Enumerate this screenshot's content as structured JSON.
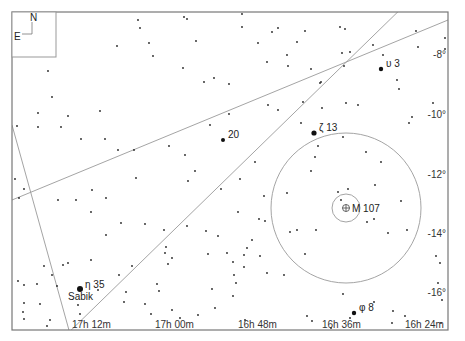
{
  "compass": {
    "north": "N",
    "east": "E"
  },
  "frame": {
    "x": 12,
    "y": 12,
    "w": 436,
    "h": 318
  },
  "ra_labels": [
    {
      "text": "17h 12m",
      "x": 72
    },
    {
      "text": "17h 00m",
      "x": 155
    },
    {
      "text": "16h 48m",
      "x": 238
    },
    {
      "text": "16h 36m",
      "x": 322
    },
    {
      "text": "16h 24m",
      "x": 405
    }
  ],
  "dec_labels": [
    {
      "text": "-8°",
      "y": 58
    },
    {
      "text": "-10°",
      "y": 118
    },
    {
      "text": "-12°",
      "y": 178
    },
    {
      "text": "-14°",
      "y": 237
    },
    {
      "text": "-16°",
      "y": 296
    }
  ],
  "named_stars": [
    {
      "label": "υ 3",
      "x": 381,
      "y": 69,
      "r": 2.2
    },
    {
      "label": "ζ 13",
      "x": 314,
      "y": 133,
      "r": 2.6
    },
    {
      "label": "20",
      "x": 223,
      "y": 140,
      "r": 2.0
    },
    {
      "label": "η 35",
      "sub": "Sabik",
      "x": 80,
      "y": 289,
      "r": 3.0
    },
    {
      "label": "φ 8",
      "x": 354,
      "y": 313,
      "r": 2.2
    }
  ],
  "deep_sky": {
    "label": "M 107",
    "x": 346,
    "y": 208,
    "inner_r": 14,
    "outer_r": 75
  },
  "lines": [
    {
      "x1": 12,
      "y1": 200,
      "x2": 448,
      "y2": 20
    },
    {
      "x1": 60,
      "y1": 341,
      "x2": 410,
      "y2": 0
    },
    {
      "x1": 12,
      "y1": 125,
      "x2": 72,
      "y2": 341
    }
  ],
  "stars": [
    [
      138,
      20
    ],
    [
      140,
      28
    ],
    [
      149,
      43
    ],
    [
      153,
      56
    ],
    [
      184,
      17
    ],
    [
      187,
      19
    ],
    [
      196,
      41
    ],
    [
      183,
      68
    ],
    [
      117,
      46
    ],
    [
      204,
      82
    ],
    [
      214,
      78
    ],
    [
      229,
      84
    ],
    [
      48,
      71
    ],
    [
      52,
      97
    ],
    [
      38,
      113
    ],
    [
      68,
      116
    ],
    [
      100,
      111
    ],
    [
      229,
      114
    ],
    [
      17,
      126
    ],
    [
      38,
      127
    ],
    [
      61,
      127
    ],
    [
      81,
      139
    ],
    [
      105,
      139
    ],
    [
      118,
      150
    ],
    [
      134,
      150
    ],
    [
      169,
      146
    ],
    [
      185,
      155
    ],
    [
      195,
      171
    ],
    [
      188,
      181
    ],
    [
      15,
      179
    ],
    [
      24,
      189
    ],
    [
      19,
      198
    ],
    [
      58,
      200
    ],
    [
      76,
      200
    ],
    [
      92,
      190
    ],
    [
      106,
      198
    ],
    [
      91,
      212
    ],
    [
      121,
      223
    ],
    [
      106,
      235
    ],
    [
      145,
      224
    ],
    [
      165,
      253
    ],
    [
      166,
      247
    ],
    [
      210,
      125
    ],
    [
      255,
      162
    ],
    [
      221,
      189
    ],
    [
      242,
      14
    ],
    [
      242,
      27
    ],
    [
      278,
      28
    ],
    [
      258,
      43
    ],
    [
      272,
      32
    ],
    [
      305,
      31
    ],
    [
      297,
      42
    ],
    [
      287,
      55
    ],
    [
      288,
      66
    ],
    [
      267,
      62
    ],
    [
      303,
      102
    ],
    [
      268,
      105
    ],
    [
      278,
      110
    ],
    [
      311,
      69
    ],
    [
      322,
      108
    ],
    [
      320,
      83
    ],
    [
      342,
      53
    ],
    [
      321,
      82
    ],
    [
      340,
      27
    ],
    [
      345,
      29
    ],
    [
      344,
      66
    ],
    [
      350,
      52
    ],
    [
      346,
      103
    ],
    [
      358,
      105
    ],
    [
      373,
      45
    ],
    [
      383,
      55
    ],
    [
      397,
      80
    ],
    [
      399,
      89
    ],
    [
      409,
      123
    ],
    [
      412,
      117
    ],
    [
      416,
      31
    ],
    [
      418,
      47
    ],
    [
      445,
      38
    ],
    [
      445,
      49
    ],
    [
      433,
      103
    ],
    [
      301,
      123
    ],
    [
      343,
      137
    ],
    [
      315,
      157
    ],
    [
      311,
      171
    ],
    [
      366,
      152
    ],
    [
      381,
      162
    ],
    [
      375,
      185
    ],
    [
      401,
      201
    ],
    [
      338,
      192
    ],
    [
      348,
      189
    ],
    [
      341,
      200
    ],
    [
      388,
      233
    ],
    [
      367,
      222
    ],
    [
      374,
      219
    ],
    [
      316,
      230
    ],
    [
      407,
      230
    ],
    [
      287,
      193
    ],
    [
      318,
      146
    ],
    [
      18,
      281
    ],
    [
      24,
      285
    ],
    [
      37,
      284
    ],
    [
      52,
      275
    ],
    [
      57,
      286
    ],
    [
      63,
      265
    ],
    [
      24,
      303
    ],
    [
      23,
      312
    ],
    [
      40,
      304
    ],
    [
      24,
      319
    ],
    [
      68,
      263
    ],
    [
      44,
      266
    ],
    [
      78,
      305
    ],
    [
      80,
      314
    ],
    [
      98,
      290
    ],
    [
      126,
      292
    ],
    [
      124,
      302
    ],
    [
      157,
      284
    ],
    [
      159,
      291
    ],
    [
      151,
      314
    ],
    [
      172,
      310
    ],
    [
      180,
      318
    ],
    [
      227,
      253
    ],
    [
      244,
      255
    ],
    [
      260,
      256
    ],
    [
      305,
      254
    ],
    [
      233,
      262
    ],
    [
      234,
      275
    ],
    [
      236,
      283
    ],
    [
      233,
      296
    ],
    [
      267,
      273
    ],
    [
      284,
      275
    ],
    [
      343,
      294
    ],
    [
      374,
      302
    ],
    [
      393,
      311
    ],
    [
      436,
      256
    ],
    [
      440,
      263
    ],
    [
      438,
      283
    ],
    [
      442,
      300
    ],
    [
      441,
      323
    ],
    [
      307,
      316
    ],
    [
      312,
      321
    ],
    [
      245,
      320
    ],
    [
      331,
      328
    ],
    [
      392,
      323
    ],
    [
      350,
      318
    ],
    [
      405,
      316
    ],
    [
      47,
      326
    ],
    [
      50,
      320
    ],
    [
      91,
      260
    ],
    [
      132,
      266
    ],
    [
      145,
      304
    ],
    [
      168,
      264
    ],
    [
      208,
      254
    ],
    [
      212,
      289
    ],
    [
      198,
      315
    ],
    [
      215,
      308
    ],
    [
      247,
      248
    ],
    [
      218,
      236
    ],
    [
      238,
      212
    ],
    [
      264,
      196
    ],
    [
      290,
      232
    ],
    [
      259,
      219
    ],
    [
      297,
      230
    ],
    [
      244,
      267
    ],
    [
      252,
      240
    ],
    [
      172,
      258
    ],
    [
      119,
      275
    ],
    [
      187,
      226
    ],
    [
      164,
      230
    ],
    [
      206,
      231
    ],
    [
      136,
      178
    ],
    [
      240,
      179
    ],
    [
      265,
      221
    ]
  ]
}
